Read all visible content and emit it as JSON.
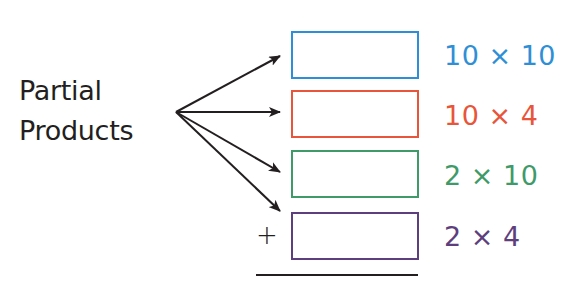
{
  "title": {
    "line1": "Partial",
    "line2": "Products"
  },
  "operator": "+",
  "rows": [
    {
      "label": "10 × 10",
      "color": "#2f8fd6",
      "top": 31
    },
    {
      "label": "10 × 4",
      "color": "#e8553a",
      "top": 90
    },
    {
      "label": "2 × 10",
      "color": "#3f9a6a",
      "top": 150
    },
    {
      "label": "2 × 4",
      "color": "#5e3f7e",
      "top": 212
    }
  ],
  "arrows": {
    "origin": [
      176,
      112
    ],
    "tips": [
      [
        280,
        56
      ],
      [
        280,
        112
      ],
      [
        280,
        172
      ],
      [
        280,
        211
      ]
    ],
    "color": "#231f20"
  }
}
